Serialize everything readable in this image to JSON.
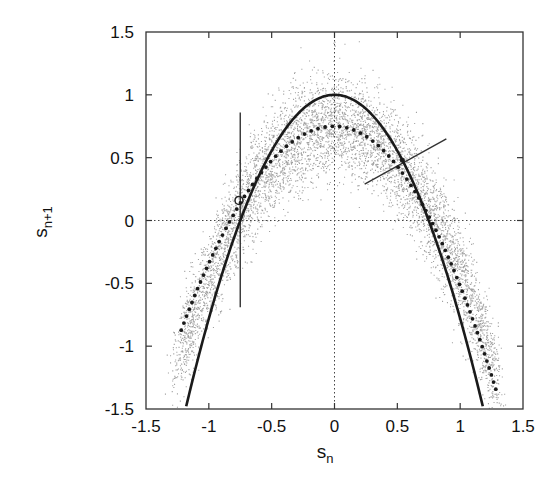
{
  "chart_data": {
    "type": "scatter",
    "title": "",
    "xlabel": "s_n",
    "ylabel": "s_{n+1}",
    "xlabel_main": "s",
    "xlabel_sub": "n",
    "ylabel_main": "s",
    "ylabel_sub": "n+1",
    "xlim": [
      -1.5,
      1.5
    ],
    "ylim": [
      -1.5,
      1.5
    ],
    "x_ticks": [
      -1.5,
      -1,
      -0.5,
      0,
      0.5,
      1,
      1.5
    ],
    "y_ticks": [
      -1.5,
      -1,
      -0.5,
      0,
      0.5,
      1,
      1.5
    ],
    "x_tick_labels": [
      "-1.5",
      "-1",
      "-0.5",
      "0",
      "0.5",
      "1",
      "1.5"
    ],
    "y_tick_labels": [
      "-1.5",
      "-1",
      "-0.5",
      "0",
      "0.5",
      "1",
      "1.5"
    ],
    "grid": false,
    "zero_lines": {
      "x": 0,
      "y": 0,
      "style": "dotted"
    },
    "legend": null,
    "series": [
      {
        "name": "noisy return-map samples",
        "kind": "scatter-cloud",
        "description": "dense cloud of small points scattered around the dotted parabola",
        "center_curve": {
          "peak": 0.75,
          "curvature": 1.2
        },
        "noise_sd": 0.2,
        "x_range": [
          -1.25,
          1.3
        ],
        "n_points": 6000,
        "color": "#555555"
      },
      {
        "name": "solid parabola",
        "kind": "line",
        "style": "solid",
        "formula": "y = 1 - 1.78 x^2",
        "x": [
          -1.18,
          -1.0,
          -0.75,
          -0.5,
          -0.25,
          0,
          0.25,
          0.5,
          0.75,
          1.0,
          1.18
        ],
        "y": [
          -1.5,
          -0.78,
          0.0,
          0.555,
          0.889,
          1.0,
          0.889,
          0.555,
          0.0,
          -0.78,
          -1.5
        ],
        "color": "#1a1a1a"
      },
      {
        "name": "dotted parabola",
        "kind": "line",
        "style": "dotted",
        "formula": "y ≈ 0.75 - 1.2 x^2",
        "x": [
          -1.22,
          -1.0,
          -0.75,
          -0.5,
          -0.25,
          0,
          0.25,
          0.5,
          0.75,
          1.0,
          1.3
        ],
        "y": [
          -0.87,
          -0.45,
          0.08,
          0.45,
          0.68,
          0.75,
          0.68,
          0.45,
          0.08,
          -0.45,
          -1.39
        ],
        "color": "#1a1a1a"
      }
    ],
    "annotations": [
      {
        "kind": "vertical-segment",
        "x": -0.75,
        "y_from": -0.69,
        "y_to": 0.86
      },
      {
        "kind": "open-circle-marker",
        "x": -0.76,
        "y": 0.16
      },
      {
        "kind": "slanted-segment",
        "from": [
          0.24,
          0.29
        ],
        "to": [
          0.89,
          0.65
        ]
      },
      {
        "kind": "intersection-point",
        "x": 0.54,
        "y": 0.48
      }
    ]
  }
}
